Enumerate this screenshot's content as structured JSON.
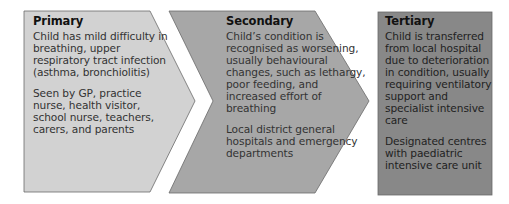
{
  "colors": {
    "primary_fill": "#d2d2d2",
    "secondary_fill": "#a7a7a7",
    "tertiary_fill": "#888888",
    "outline": "#6a6a6a"
  },
  "stages": [
    {
      "title": "Primary",
      "description": "Child has mild difficulty in breathing, upper respiratory tract infection (asthma, bronchiolitis)",
      "care_providers": "Seen by GP, practice nurse, health visitor, school nurse, teachers, carers, and parents"
    },
    {
      "title": "Secondary",
      "description": "Child’s condition is recognised as worsening, usually behavioural changes, such as lethargy, poor feeding, and increased effort of breathing",
      "care_providers": "Local district general hospitals and emergency departments"
    },
    {
      "title": "Tertiary",
      "description": "Child is transferred from local hospital due to deterioration in condition, usually requiring ventilatory support and specialist intensive care",
      "care_providers": "Designated centres with paediatric intensive care unit"
    }
  ]
}
